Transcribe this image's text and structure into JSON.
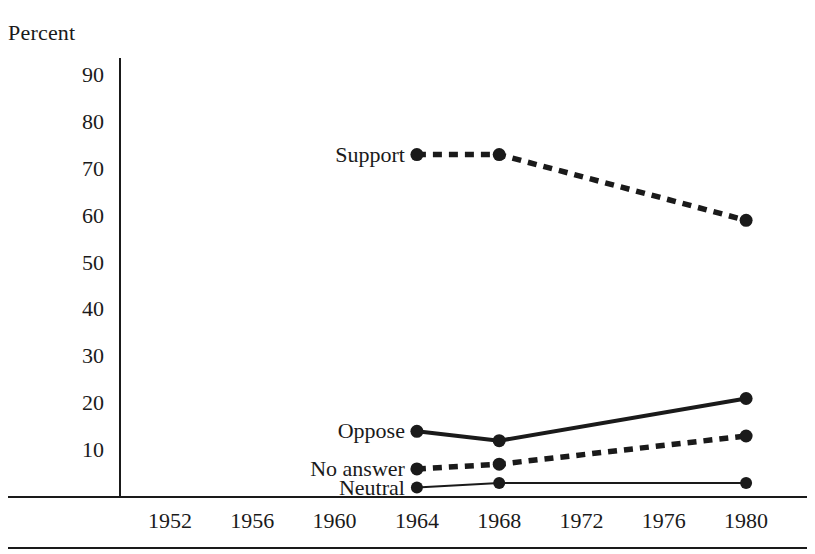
{
  "chart_data": {
    "type": "line",
    "title": "",
    "subtitle": "",
    "xlabel": "",
    "ylabel": "Percent",
    "x": [
      1952,
      1956,
      1960,
      1964,
      1968,
      1972,
      1976,
      1980
    ],
    "xticklabels": [
      "1952",
      "1956",
      "1960",
      "1964",
      "1968",
      "1972",
      "1976",
      "1980"
    ],
    "yticklabels": [
      "90",
      "80",
      "70",
      "60",
      "50",
      "40",
      "30",
      "20",
      "10"
    ],
    "yticks": [
      90,
      80,
      70,
      60,
      50,
      40,
      30,
      20,
      10
    ],
    "ylim": [
      0,
      95
    ],
    "xlim": [
      1950,
      1982
    ],
    "grid": false,
    "legend_position": "inline-left-of-series",
    "series": [
      {
        "name": "Support",
        "style": "dashed-thick",
        "x": [
          1964,
          1968,
          1980
        ],
        "values": [
          73,
          73,
          59
        ],
        "label": "Support"
      },
      {
        "name": "Oppose",
        "style": "solid-thick",
        "x": [
          1964,
          1968,
          1980
        ],
        "values": [
          14,
          12,
          21
        ],
        "label": "Oppose"
      },
      {
        "name": "No answer",
        "style": "dashed-thick",
        "x": [
          1964,
          1968,
          1980
        ],
        "values": [
          6,
          7,
          13
        ],
        "label": "No answer"
      },
      {
        "name": "Neutral",
        "style": "solid-thin",
        "x": [
          1964,
          1968,
          1980
        ],
        "values": [
          2,
          3,
          3
        ],
        "label": "Neutral"
      }
    ],
    "colors": {
      "ink": "#1a1a1a",
      "background": "#ffffff"
    }
  }
}
